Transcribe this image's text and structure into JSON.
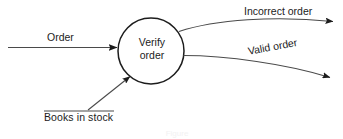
{
  "diagram": {
    "type": "data-flow-diagram",
    "background_color": "#ffffff",
    "stroke_color": "#1c1c1c",
    "process": {
      "shape": "circle",
      "label_line_1": "Verify",
      "label_line_2": "order",
      "center_x": 151,
      "center_y": 51,
      "radius": 33
    },
    "data_store": {
      "label": "Books in stock",
      "notation": "underline-bar"
    },
    "flows": [
      {
        "label": "Order",
        "direction": "into-process",
        "style": "straight-arrow",
        "from": "external-left",
        "to": "verify-order"
      },
      {
        "label": "Books in stock",
        "direction": "into-process",
        "style": "diagonal-arrow",
        "from": "books-in-stock-store",
        "to": "verify-order"
      },
      {
        "label": "Incorrect order",
        "direction": "out-of-process",
        "style": "curved-arrow",
        "from": "verify-order",
        "to": "external-right-top"
      },
      {
        "label": "Valid order",
        "direction": "out-of-process",
        "style": "curved-arrow",
        "from": "verify-order",
        "to": "external-right-bottom"
      }
    ],
    "caption": "Figure"
  }
}
